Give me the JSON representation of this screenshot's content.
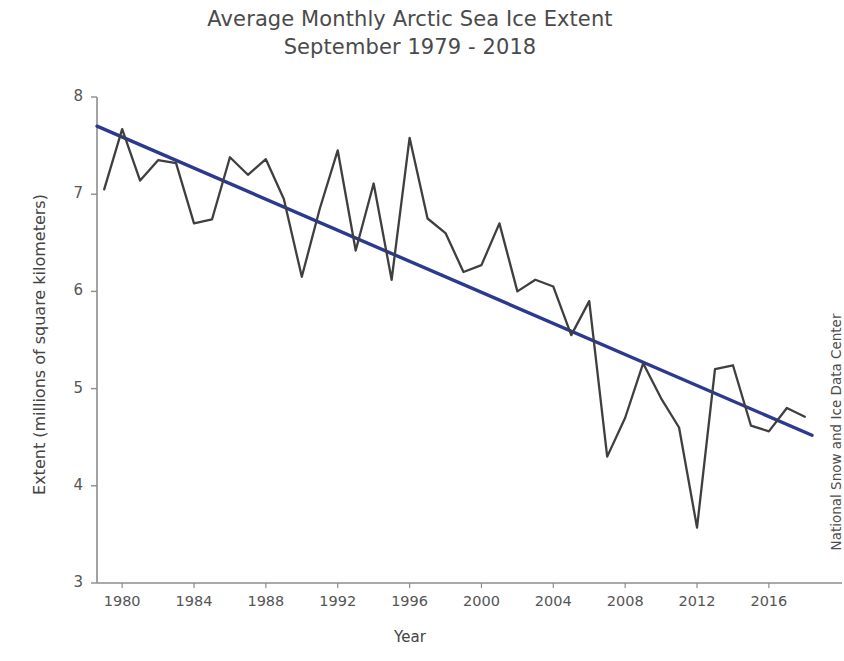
{
  "chart_data": {
    "type": "line",
    "title": "Average Monthly Arctic Sea Ice Extent",
    "subtitle": "September 1979 - 2018",
    "title_lines": [
      "Average Monthly Arctic Sea Ice Extent",
      "September 1979 - 2018"
    ],
    "xlabel": "Year",
    "ylabel": "Extent (millions of square kilometers)",
    "credit": "National Snow and Ice Data Center",
    "grid": false,
    "legend": "none",
    "xlim": [
      1978.6,
      2018.4
    ],
    "ylim": [
      3,
      8
    ],
    "xticks": [
      1980,
      1984,
      1988,
      1992,
      1996,
      2000,
      2004,
      2008,
      2012,
      2016
    ],
    "yticks": [
      3,
      4,
      5,
      6,
      7,
      8
    ],
    "xtick_labels": [
      "1980",
      "1984",
      "1988",
      "1992",
      "1996",
      "2000",
      "2004",
      "2008",
      "2012",
      "2016"
    ],
    "ytick_labels": [
      "3",
      "4",
      "5",
      "6",
      "7",
      "8"
    ],
    "colors": {
      "data_line": "#3f3f3f",
      "trend_line": "#2b3a8f",
      "axis": "#8c8c8c",
      "text": "#4a4a4a"
    },
    "x": [
      1979,
      1980,
      1981,
      1982,
      1983,
      1984,
      1985,
      1986,
      1987,
      1988,
      1989,
      1990,
      1991,
      1992,
      1993,
      1994,
      1995,
      1996,
      1997,
      1998,
      1999,
      2000,
      2001,
      2002,
      2003,
      2004,
      2005,
      2006,
      2007,
      2008,
      2009,
      2010,
      2011,
      2012,
      2013,
      2014,
      2015,
      2016,
      2017,
      2018
    ],
    "series": [
      {
        "name": "September sea ice extent",
        "values": [
          7.05,
          7.67,
          7.14,
          7.35,
          7.32,
          6.7,
          6.74,
          7.38,
          7.2,
          7.36,
          6.95,
          6.15,
          6.85,
          7.45,
          6.42,
          7.11,
          6.12,
          7.58,
          6.75,
          6.6,
          6.2,
          6.27,
          6.7,
          6.0,
          6.12,
          6.05,
          5.55,
          5.9,
          4.3,
          4.7,
          5.26,
          4.9,
          4.6,
          3.57,
          5.2,
          5.24,
          4.62,
          4.56,
          4.8,
          4.71
        ]
      },
      {
        "name": "Linear trend",
        "type": "trend",
        "x_endpoints": [
          1978.6,
          2018.4
        ],
        "y_endpoints": [
          7.7,
          4.52
        ]
      }
    ]
  }
}
